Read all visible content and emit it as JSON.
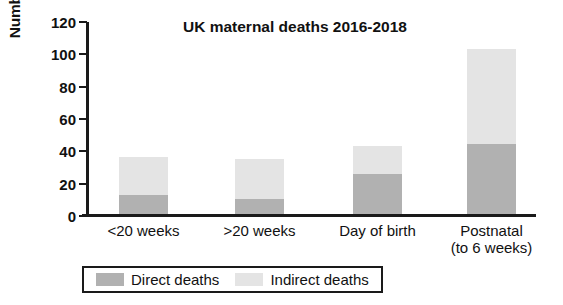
{
  "chart_data": {
    "type": "bar",
    "subtype": "stacked-bar",
    "title": "UK maternal deaths 2016-2018",
    "xlabel": "",
    "ylabel": "Number of deaths",
    "categories": [
      "<20 weeks",
      ">20 weeks",
      "Day of birth",
      "Postnatal"
    ],
    "category_sublabels": [
      "",
      "",
      "",
      "(to 6 weeks)"
    ],
    "series": [
      {
        "name": "Direct deaths",
        "values": [
          12,
          9,
          25,
          43
        ],
        "color": "#b1b1b1"
      },
      {
        "name": "Indirect deaths",
        "values": [
          23,
          25,
          17,
          59
        ],
        "color": "#e4e4e4"
      }
    ],
    "totals": [
      35,
      34,
      42,
      102
    ],
    "ylim": [
      0,
      120
    ],
    "yticks": [
      0,
      20,
      40,
      60,
      80,
      100,
      120
    ],
    "ytick_labels": [
      "0",
      "20",
      "40",
      "60",
      "80",
      "100",
      "120"
    ],
    "grid": false,
    "legend_position": "bottom-left",
    "legend_entries": [
      "Direct deaths",
      "Indirect deaths"
    ],
    "axis_color": "#1a1a1a",
    "background_color": "#ffffff"
  }
}
